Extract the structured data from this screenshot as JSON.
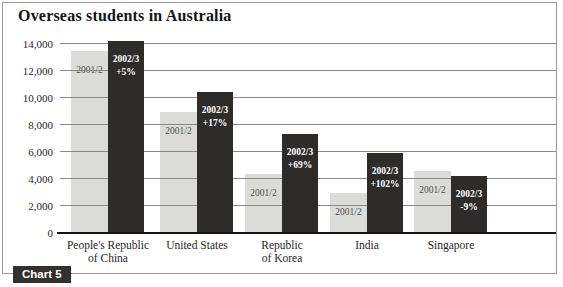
{
  "title": "Overseas students in Australia",
  "badge_label": "Chart 5",
  "chart_data": {
    "type": "bar",
    "title": "Overseas students in Australia",
    "categories": [
      "People's Republic of China",
      "United States",
      "Republic of Korea",
      "India",
      "Singapore"
    ],
    "category_label_lines": [
      [
        "People's Republic",
        "of China"
      ],
      [
        "United States"
      ],
      [
        "Republic",
        "of Korea"
      ],
      [
        "India"
      ],
      [
        "Singapore"
      ]
    ],
    "series": [
      {
        "name": "2001/2",
        "values": [
          13500,
          8950,
          4350,
          2950,
          4600
        ]
      },
      {
        "name": "2002/3",
        "values": [
          14200,
          10470,
          7350,
          5960,
          4190
        ]
      }
    ],
    "change_labels": [
      "+5%",
      "+17%",
      "+69%",
      "+102%",
      "-9%"
    ],
    "ylim": [
      0,
      14000
    ],
    "ytick_interval": 2000,
    "ytick_labels": [
      "0",
      "2,000",
      "4,000",
      "6,000",
      "8,000",
      "10,000",
      "12,000",
      "14,000"
    ],
    "grid": true,
    "legend_position": "in-bar",
    "colors": {
      "bar_2001_2": "#dbdbd9",
      "bar_2002_3": "#2e2c2b",
      "grid": "#898989",
      "baseline": "#141414",
      "badge_background": "#33312e"
    }
  }
}
